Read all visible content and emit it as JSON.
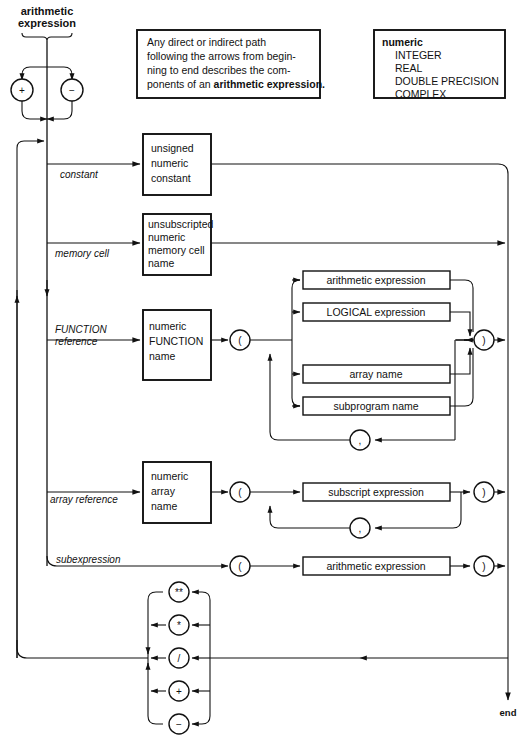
{
  "diagram": {
    "title": "arithmetic expression",
    "end_label": "end",
    "note": {
      "line1": "Any direct or indirect path",
      "line2": "following the arrows from begin-",
      "line3": "ning to end describes the com-",
      "line4_plain": "ponents of an ",
      "line4_bold": "arithmetic expression."
    },
    "legend": {
      "heading": "numeric",
      "items": [
        "INTEGER",
        "REAL",
        "DOUBLE PRECISION",
        "COMPLEX"
      ]
    },
    "sign_operators": [
      "+",
      "−"
    ],
    "branches": [
      {
        "label": "constant",
        "box": [
          "unsigned",
          "numeric",
          "constant"
        ]
      },
      {
        "label": "memory cell",
        "box": [
          "unsubscripted",
          "numeric",
          "memory cell",
          "name"
        ]
      },
      {
        "label_line1": "FUNCTION",
        "label_line2": "reference",
        "box": [
          "numeric",
          "FUNCTION",
          "name"
        ]
      },
      {
        "label": "array reference",
        "box": [
          "numeric",
          "array",
          "name"
        ]
      },
      {
        "label": "subexpression",
        "box": []
      }
    ],
    "function_arguments": [
      "arithmetic expression",
      "LOGICAL expression",
      "array name",
      "subprogram name"
    ],
    "array_argument": "subscript expression",
    "subexpression_argument": "arithmetic expression",
    "paren_open": "(",
    "paren_close": ")",
    "comma": ",",
    "binary_operators": [
      "**",
      "*",
      "/",
      "+",
      "−"
    ],
    "colors": {
      "ink": "#111111",
      "paper": "#ffffff"
    }
  }
}
